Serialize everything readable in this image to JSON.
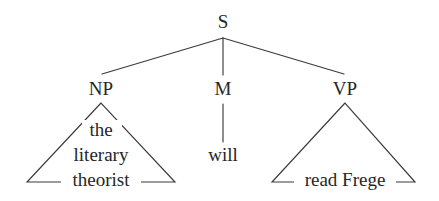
{
  "figure": {
    "kind": "syntax-tree",
    "background_color": "#ffffff",
    "line_color": "#3a3a3a",
    "text_color": "#262626",
    "sentence": "the literary theorist will read Frege"
  },
  "nodes": {
    "root": {
      "label": "S",
      "x": 223,
      "y": 28
    },
    "np": {
      "label": "NP",
      "x": 101,
      "y": 95
    },
    "m": {
      "label": "M",
      "x": 223,
      "y": 95
    },
    "vp": {
      "label": "VP",
      "x": 345,
      "y": 95
    }
  },
  "terminals": {
    "np_line1": {
      "text": "the",
      "x": 101,
      "y": 136
    },
    "np_line2": {
      "text": "literary",
      "x": 101,
      "y": 161
    },
    "np_line3": {
      "text": "theorist",
      "x": 101,
      "y": 186
    },
    "m_word": {
      "text": "will",
      "x": 223,
      "y": 161
    },
    "vp_word": {
      "text": "read Frege",
      "x": 345,
      "y": 186
    }
  },
  "triangles": {
    "np": {
      "apex_x": 101,
      "apex_y": 103,
      "left_x": 27,
      "right_x": 175,
      "base_y": 182
    },
    "vp": {
      "apex_x": 345,
      "apex_y": 103,
      "left_x": 272,
      "right_x": 415,
      "base_y": 182
    }
  },
  "branches": {
    "s_to_np": {
      "x1": 223,
      "y1": 38,
      "x2": 102,
      "y2": 74
    },
    "s_to_m": {
      "x1": 223,
      "y1": 38,
      "x2": 223,
      "y2": 75
    },
    "s_to_vp": {
      "x1": 223,
      "y1": 38,
      "x2": 344,
      "y2": 74
    },
    "m_to_will": {
      "x1": 223,
      "y1": 104,
      "x2": 223,
      "y2": 142
    }
  }
}
